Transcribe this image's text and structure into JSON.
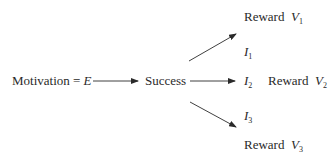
{
  "diagram": {
    "nodes": {
      "motivation": {
        "text": "Motivation = ",
        "var": "E"
      },
      "success": {
        "text": "Success"
      },
      "reward1": {
        "text": "Reward",
        "var": "V",
        "sub": "1"
      },
      "reward2": {
        "text": "Reward",
        "var": "V",
        "sub": "2"
      },
      "reward3": {
        "text": "Reward",
        "var": "V",
        "sub": "3"
      },
      "i1": {
        "var": "I",
        "sub": "1"
      },
      "i2": {
        "var": "I",
        "sub": "2"
      },
      "i3": {
        "var": "I",
        "sub": "3"
      }
    },
    "edges": [
      {
        "from": "motivation",
        "to": "success"
      },
      {
        "from": "success",
        "to": "reward1",
        "label": "I1"
      },
      {
        "from": "success",
        "to": "reward2",
        "label": "I2"
      },
      {
        "from": "success",
        "to": "reward3",
        "label": "I3"
      }
    ],
    "colors": {
      "ink": "#2a2a2a"
    }
  }
}
